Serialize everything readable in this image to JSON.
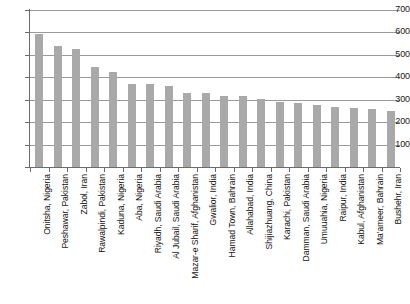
{
  "chart_data": {
    "type": "bar",
    "title": "",
    "subtitle": "",
    "xlabel": "",
    "ylabel": "",
    "ylim": [
      0,
      700
    ],
    "yticks": [
      0,
      100,
      200,
      300,
      400,
      500,
      600,
      700
    ],
    "ytick_labels": [
      "",
      "100",
      "200",
      "300",
      "400",
      "500",
      "600",
      "700"
    ],
    "grid": "horizontal",
    "legend": "none",
    "bar_color": "#a9a9a9",
    "categories": [
      "Onitsha, Nigeria",
      "Peshawar, Pakistan",
      "Zabol, Iran",
      "Rawalpindi, Pakistan",
      "Kaduna, Nigeria",
      "Aba, Nigeria",
      "Riyadh, Saudi Arabia",
      "Al Jubail, Saudi Arabia",
      "Mazar-e Sharif, Afghanistan",
      "Gwalior, India",
      "Hamad Town, Bahrain",
      "Allahabad, India",
      "Shijiazhuang, China",
      "Karachi, Pakistan",
      "Damman, Saudi Arabia",
      "Umuuahia, Nigeria",
      "Raipur, India",
      "Kabul, Afghanistan",
      "Ma'ameer, Bahrain",
      "Bushehr, Iran"
    ],
    "values": [
      594,
      540,
      527,
      448,
      423,
      371,
      368,
      359,
      332,
      329,
      317,
      317,
      305,
      290,
      286,
      277,
      268,
      261,
      259,
      250
    ]
  }
}
